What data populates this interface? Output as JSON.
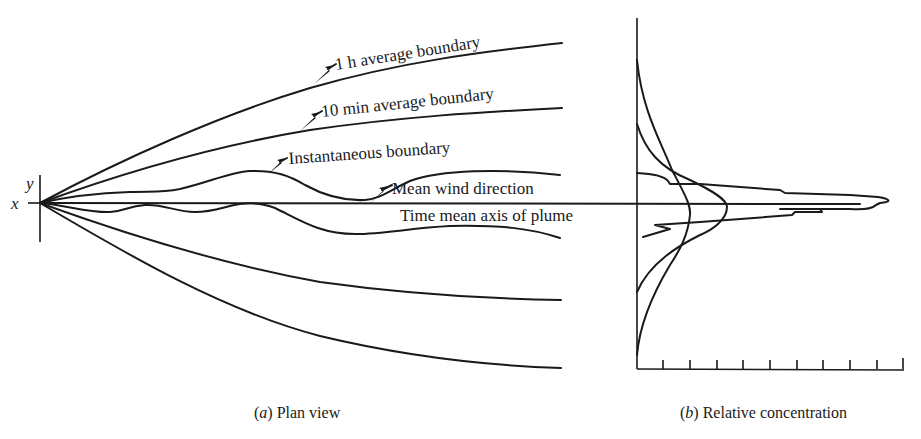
{
  "panel_a": {
    "caption_letter": "a",
    "caption_text": " Plan view",
    "axis_labels": {
      "x": "x",
      "y": "y"
    },
    "labels": {
      "one_hour": "1 h average boundary",
      "ten_min": "10 min average boundary",
      "instantaneous": "Instantaneous boundary",
      "mean_wind": "Mean wind direction",
      "time_mean_axis": "Time mean axis of plume"
    }
  },
  "panel_b": {
    "caption_letter": "b",
    "caption_text": " Relative concentration",
    "tick_count": 10
  },
  "colors": {
    "ink": "#1a1a1a",
    "background": "#ffffff"
  }
}
